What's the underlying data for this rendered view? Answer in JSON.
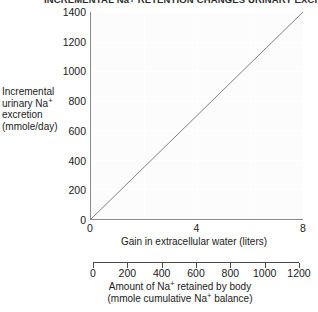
{
  "chart_data": {
    "type": "line",
    "title": "INCREMENTAL Na+ RETENTION CHANGES URINARY EXCRETION",
    "x": [
      0,
      8
    ],
    "y": [
      0,
      1400
    ],
    "series": [
      {
        "name": "Incremental urinary Na+ excretion",
        "x": [
          0,
          8
        ],
        "values": [
          0,
          1400
        ]
      }
    ],
    "xlabel": "Gain in extracellular water (liters)",
    "ylabel": "Incremental urinary Na  excretion (mmole/day)",
    "xlim": [
      0,
      8
    ],
    "ylim": [
      0,
      1400
    ],
    "xticks": [
      "0",
      "4",
      "8"
    ],
    "yticks": [
      "0",
      "200",
      "400",
      "600",
      "800",
      "1000",
      "1200",
      "1400"
    ],
    "grid": true,
    "legend": "none",
    "secondary_axis": {
      "label_line1": "Amount of Na",
      "label_line1b": " retained by body",
      "label_line2": "(mmole cumulative Na",
      "label_line2b": " balance)",
      "ticks": [
        "0",
        "200",
        "400",
        "600",
        "800",
        "1000",
        "1200"
      ],
      "lim": [
        0,
        1200
      ]
    },
    "colors": {
      "line": "#5f5f5f",
      "axis": "#8a8a8a",
      "plot_background": "#fcfcfc",
      "gridline": "#ffffff",
      "text": "#1a1a1a"
    }
  },
  "y_axis_title": {
    "line1": "Incremental",
    "line2a": "urinary Na",
    "line2b": "",
    "line3": "excretion",
    "line4": "(mmole/day)",
    "superscript": "+"
  }
}
